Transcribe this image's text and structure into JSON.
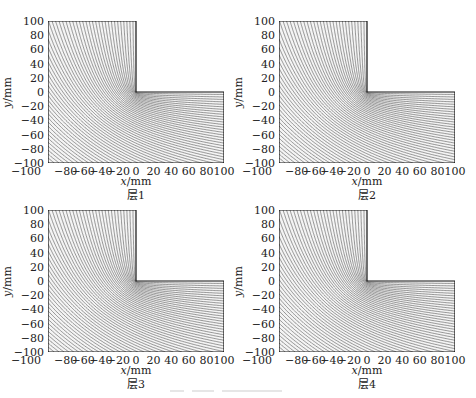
{
  "chart_data": [
    {
      "type": "contour",
      "title": "",
      "caption": "层1",
      "xlabel": "x/mm",
      "ylabel": "y/mm",
      "xlim": [
        -100,
        100
      ],
      "ylim": [
        -100,
        100
      ],
      "xticks": [
        -100,
        -80,
        -60,
        -40,
        -20,
        0,
        20,
        40,
        60,
        80,
        100
      ],
      "yticks": [
        -100,
        -80,
        -60,
        -40,
        -20,
        0,
        20,
        40,
        60,
        80,
        100
      ],
      "domain_shape": "L-shape: x in [-100,0] for y in [0,100]; x in [-100,100] for y in [-100,0]",
      "line_color": "#555555",
      "grid": false
    },
    {
      "type": "contour",
      "title": "",
      "caption": "层2",
      "xlabel": "x/mm",
      "ylabel": "y/mm",
      "xlim": [
        -100,
        100
      ],
      "ylim": [
        -100,
        100
      ],
      "xticks": [
        -100,
        -80,
        -60,
        -40,
        -20,
        0,
        20,
        40,
        60,
        80,
        100
      ],
      "yticks": [
        -100,
        -80,
        -60,
        -40,
        -20,
        0,
        20,
        40,
        60,
        80,
        100
      ],
      "domain_shape": "L-shape",
      "line_color": "#555555",
      "grid": false
    },
    {
      "type": "contour",
      "title": "",
      "caption": "层3",
      "xlabel": "x/mm",
      "ylabel": "y/mm",
      "xlim": [
        -100,
        100
      ],
      "ylim": [
        -100,
        100
      ],
      "xticks": [
        -100,
        -80,
        -60,
        -40,
        -20,
        0,
        20,
        40,
        60,
        80,
        100
      ],
      "yticks": [
        -100,
        -80,
        -60,
        -40,
        -20,
        0,
        20,
        40,
        60,
        80,
        100
      ],
      "domain_shape": "L-shape",
      "line_color": "#555555",
      "grid": false
    },
    {
      "type": "contour",
      "title": "",
      "caption": "层4",
      "xlabel": "x/mm",
      "ylabel": "y/mm",
      "xlim": [
        -100,
        100
      ],
      "ylim": [
        -100,
        100
      ],
      "xticks": [
        -100,
        -80,
        -60,
        -40,
        -20,
        0,
        20,
        40,
        60,
        80,
        100
      ],
      "yticks": [
        -100,
        -80,
        -60,
        -40,
        -20,
        0,
        20,
        40,
        60,
        80,
        100
      ],
      "domain_shape": "L-shape",
      "line_color": "#555555",
      "grid": false
    }
  ],
  "panels": [
    {
      "caption": "层1",
      "xlabel_var": "x",
      "xlabel_unit": "/mm",
      "ylabel_var": "y",
      "ylabel_unit": "/mm"
    },
    {
      "caption": "层2",
      "xlabel_var": "x",
      "xlabel_unit": "/mm",
      "ylabel_var": "y",
      "ylabel_unit": "/mm"
    },
    {
      "caption": "层3",
      "xlabel_var": "x",
      "xlabel_unit": "/mm",
      "ylabel_var": "y",
      "ylabel_unit": "/mm"
    },
    {
      "caption": "层4",
      "xlabel_var": "x",
      "xlabel_unit": "/mm",
      "ylabel_var": "y",
      "ylabel_unit": "/mm"
    }
  ],
  "ticks": {
    "x": [
      "−100",
      "−80",
      "−60",
      "−40",
      "−20",
      "0",
      "20",
      "40",
      "60",
      "80",
      "100"
    ],
    "y": [
      "100",
      "80",
      "60",
      "40",
      "20",
      "0",
      "−20",
      "−40",
      "−60",
      "−80",
      "−100"
    ]
  }
}
